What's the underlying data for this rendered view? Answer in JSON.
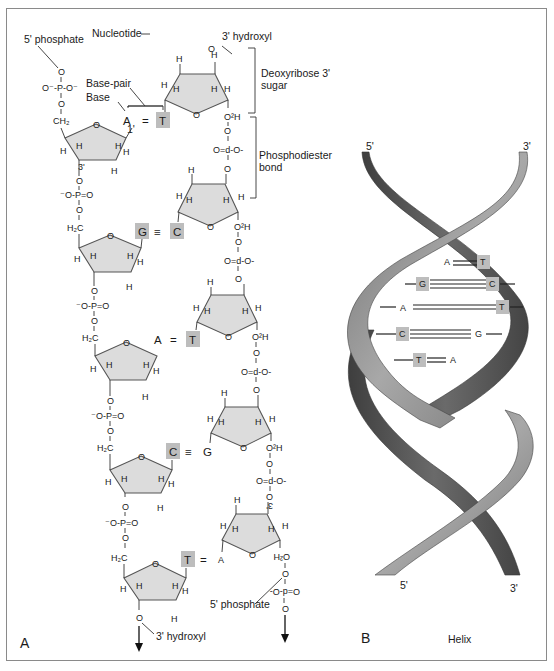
{
  "panel_a": {
    "letter": "A",
    "title_labels": {
      "five_phosphate_top": "5' phosphate",
      "nucleotide": "Nucleotide",
      "three_hydroxyl_top": "3' hydroxyl",
      "deoxyribose": "Deoxyribose 3'",
      "deoxyribose_2": "sugar",
      "base_pair": "Base-pair",
      "base": "Base",
      "phosphodiester": "Phosphodiester",
      "phosphodiester_2": "bond",
      "five_phosphate_bottom": "5' phosphate",
      "three_hydroxyl_bottom": "3' hydroxyl",
      "one_prime": "1'",
      "three_prime": "3'"
    },
    "phosphate_left_top": "O⁻-P-O⁻",
    "phosphate_left": "⁻O-P=O",
    "phosphate_right": "O=d-O-",
    "ch2": "CH₂",
    "h2c": "H₂C",
    "o2h": "O²H",
    "o": "O",
    "h": "H",
    "base_pairs": [
      {
        "left": "A",
        "right": "T",
        "bond": "=",
        "highlight": "right"
      },
      {
        "left": "G",
        "right": "C",
        "bond": "≡",
        "highlight": "both"
      },
      {
        "left": "A",
        "right": "T",
        "bond": "=",
        "highlight": "right"
      },
      {
        "left": "C",
        "right": "G",
        "bond": "≡",
        "highlight": "left"
      },
      {
        "left": "T",
        "right": "A",
        "bond": "=",
        "highlight": "left"
      }
    ]
  },
  "panel_b": {
    "letter": "B",
    "caption": "Helix",
    "top_left_end": "5'",
    "top_right_end": "3'",
    "bottom_left_end": "5'",
    "bottom_right_end": "3'",
    "rungs": [
      {
        "left": "A",
        "right": "T",
        "highlight": "right"
      },
      {
        "left": "G",
        "right": "C",
        "highlight": "both"
      },
      {
        "left": "A",
        "right": "T",
        "highlight": "right"
      },
      {
        "left": "C",
        "right": "G",
        "highlight": "left"
      },
      {
        "left": "T",
        "right": "A",
        "highlight": "left"
      }
    ],
    "strand_dark": "#5a5a5a",
    "strand_light": "#8c8c8c"
  }
}
